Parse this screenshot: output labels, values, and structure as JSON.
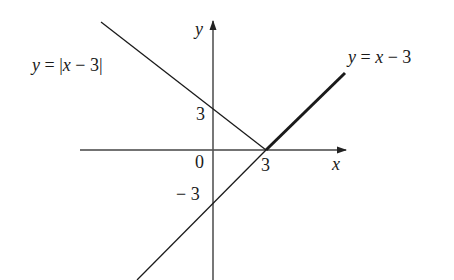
{
  "figure": {
    "type": "function-graph",
    "background": "#ffffff",
    "ink_color": "#1a1a1a",
    "axis_color": "#444444"
  },
  "axes": {
    "x_label": "x",
    "y_label": "y",
    "origin_label": "0"
  },
  "ticks": {
    "x_tick_3": "3",
    "y_tick_3": "3",
    "y_tick_neg3": "− 3"
  },
  "curves": {
    "abs": {
      "label_y": "y",
      "label_eq": " = |",
      "label_x": "x",
      "label_rest": " − 3|",
      "full_label": "y = |x − 3|",
      "expression": "|x - 3|",
      "style": "thin"
    },
    "linear": {
      "label_y": "y",
      "label_eq": " = ",
      "label_x": "x",
      "label_rest": " − 3",
      "full_label": "y = x − 3",
      "expression": "x - 3",
      "style": "thin line with thick segment for x >= 3"
    }
  },
  "key_points": {
    "vertex": "(3, 0)",
    "y_intercept_abs": "(0, 3)",
    "y_intercept_linear": "(0, -3)"
  }
}
